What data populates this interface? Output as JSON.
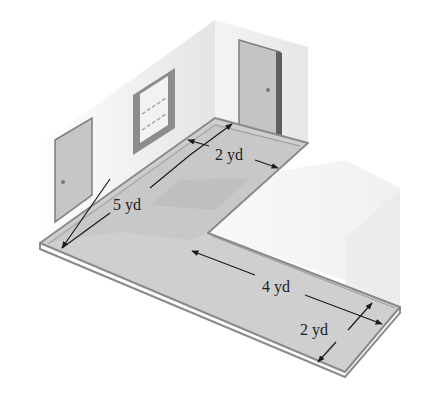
{
  "figure": {
    "type": "isometric L-shaped floor plan",
    "labels": {
      "long_left": "5 yd",
      "top_width": "2 yd",
      "lower_length": "4 yd",
      "lower_width": "2 yd"
    }
  },
  "colors": {
    "floor": "#c9c9c9",
    "floor_dark": "#b4b4b4",
    "floor_edge": "#8a8a8a",
    "wall_left": "#ececec",
    "wall_right": "#e2e2e2",
    "door": "#c4c4c4",
    "door_frame": "#7d7d7d",
    "box": "#f1f1f1",
    "dim_line": "#1a1a1a"
  }
}
